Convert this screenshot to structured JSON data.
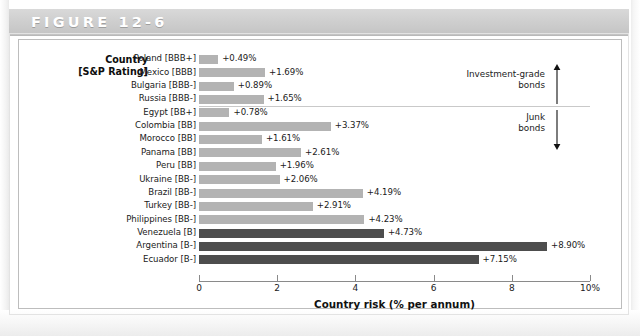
{
  "figure": {
    "banner_label": "FIGURE 12-6",
    "left_axis_caption_line1": "Country",
    "left_axis_caption_line2": "[S&P Rating]"
  },
  "annotations": {
    "investment_grade_line1": "Investment-grade",
    "investment_grade_line2": "bonds",
    "junk_line1": "Junk",
    "junk_line2": "bonds",
    "investment_arrow_icon": "arrow-up-icon",
    "junk_arrow_icon": "arrow-down-icon"
  },
  "colors": {
    "bar_investment_grade": "#b3b3b3",
    "bar_junk_light": "#b3b3b3",
    "bar_junk_dark": "#4d4d4d",
    "banner": "#cfcfcf",
    "axis": "#8a8a8a"
  },
  "chart_data": {
    "type": "bar",
    "orientation": "horizontal",
    "title": "FIGURE 12-6",
    "xlabel": "Country risk (% per annum)",
    "ylabel": "Country [S&P Rating]",
    "xlim": [
      0,
      10
    ],
    "xticks": [
      0,
      2,
      4,
      6,
      8,
      10
    ],
    "xticklabels": [
      "0",
      "2",
      "4",
      "6",
      "8",
      "10%"
    ],
    "grid": false,
    "legend": false,
    "categories": [
      "Poland [BBB+]",
      "Mexico [BBB]",
      "Bulgaria [BBB-]",
      "Russia [BBB-]",
      "Egypt [BB+]",
      "Colombia [BB]",
      "Morocco [BB]",
      "Panama [BB]",
      "Peru [BB]",
      "Ukraine [BB-]",
      "Brazil [BB-]",
      "Turkey [BB-]",
      "Philippines [BB-]",
      "Venezuela [B]",
      "Argentina [B-]",
      "Ecuador [B-]"
    ],
    "values": [
      0.49,
      1.69,
      0.89,
      1.65,
      0.78,
      3.37,
      1.61,
      2.61,
      1.96,
      2.06,
      4.19,
      2.91,
      4.23,
      4.73,
      8.9,
      7.15
    ],
    "value_labels": [
      "+0.49%",
      "+1.69%",
      "+0.89%",
      "+1.65%",
      "+0.78%",
      "+3.37%",
      "+1.61%",
      "+2.61%",
      "+1.96%",
      "+2.06%",
      "+4.19%",
      "+2.91%",
      "+4.23%",
      "+4.73%",
      "+8.90%",
      "+7.15%"
    ],
    "bar_shades": [
      "light",
      "light",
      "light",
      "light",
      "light",
      "light",
      "light",
      "light",
      "light",
      "light",
      "light",
      "light",
      "light",
      "dark",
      "dark",
      "dark"
    ],
    "groups": [
      {
        "name": "Investment-grade bonds",
        "rows": [
          0,
          1,
          2,
          3
        ]
      },
      {
        "name": "Junk bonds",
        "rows": [
          4,
          5,
          6,
          7,
          8,
          9,
          10,
          11,
          12,
          13,
          14,
          15
        ]
      }
    ]
  }
}
